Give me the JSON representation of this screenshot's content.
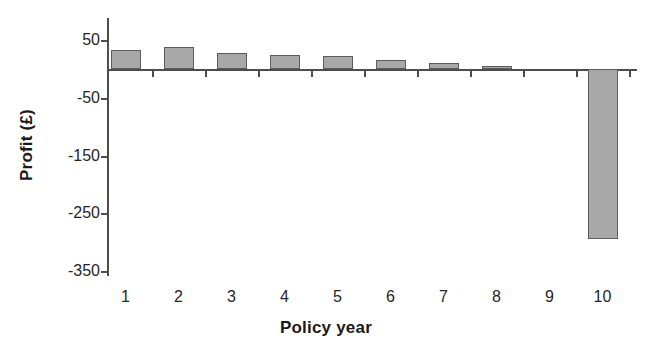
{
  "chart_data": {
    "type": "bar",
    "title": "",
    "xlabel": "Policy year",
    "ylabel": "Profit (£)",
    "categories": [
      "1",
      "2",
      "3",
      "4",
      "5",
      "6",
      "7",
      "8",
      "9",
      "10"
    ],
    "values": [
      32,
      38,
      27,
      24,
      22,
      16,
      11,
      5,
      0,
      -295
    ],
    "ylim": [
      -350,
      70
    ],
    "yticks": [
      50,
      -50,
      -150,
      -250,
      -350
    ],
    "ytick_labels": [
      "50",
      "-50",
      "-150",
      "-250",
      "-350"
    ],
    "grid": false,
    "legend": null,
    "bar_fill_color": "#a8a8a8",
    "bar_edge_color": "#5c5c5c",
    "axis_color": "#4d4d4d",
    "text_color": "#262626"
  }
}
